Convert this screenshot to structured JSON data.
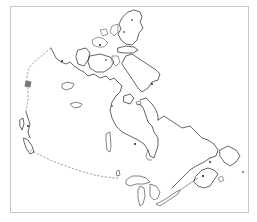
{
  "map": {
    "subject": "Canada outline map",
    "frame_color": "#c8c8c8",
    "line_color": "#222222",
    "border_style": "dashed",
    "border_color": "#777777",
    "marker": {
      "shape": "square",
      "color": "#7a7a7a"
    }
  }
}
